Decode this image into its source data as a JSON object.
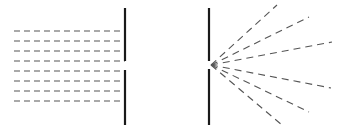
{
  "diagram": {
    "colors": {
      "barrier": "#1a1a1a",
      "wave": "#555555",
      "background": "#ffffff"
    },
    "left_panel": {
      "barrier": {
        "x": 125,
        "top_segment": [
          8,
          61
        ],
        "bottom_segment": [
          70,
          125
        ]
      },
      "incoming_wavefronts_y": [
        31,
        41,
        51,
        61,
        71,
        81,
        91,
        101
      ],
      "wavefront_x_range": [
        14,
        125
      ]
    },
    "right_panel": {
      "barrier": {
        "x": 209,
        "top_segment": [
          8,
          61
        ],
        "bottom_segment": [
          69,
          125
        ]
      },
      "slit_origin": [
        211,
        65
      ],
      "ray_endpoints": [
        [
          277,
          5
        ],
        [
          309,
          17
        ],
        [
          332,
          42
        ],
        [
          331,
          88
        ],
        [
          309,
          112
        ],
        [
          282,
          125
        ]
      ]
    }
  }
}
